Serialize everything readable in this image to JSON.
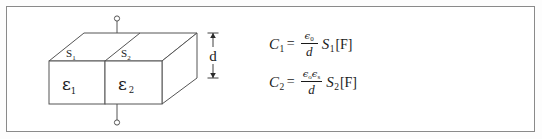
{
  "figure": {
    "type": "parallel-plate-capacitor-dielectric-diagram",
    "border_color": "#8a8a8a",
    "stroke_color": "#555555",
    "text_color": "#1a1a1a",
    "background": "#ffffff"
  },
  "diagram": {
    "name": "two-section-dielectric-slab",
    "labels": {
      "area_1": "S",
      "area_1_sub": "1",
      "area_2": "S",
      "area_2_sub": "2",
      "permittivity_1": "ε",
      "permittivity_1_sub": "1",
      "permittivity_2": "ε",
      "permittivity_2_sub": "2",
      "thickness": "d"
    },
    "terminals": {
      "top": "top-terminal-node",
      "bottom": "bottom-terminal-node"
    }
  },
  "formulas": {
    "c1": {
      "lhs": "C",
      "lhs_sub": "1",
      "eq": "=",
      "numerator_sym": "ϵ",
      "numerator_sub": "0",
      "denominator": "d",
      "area": "S",
      "area_sub": "1",
      "unit": "[F]"
    },
    "c2": {
      "lhs": "C",
      "lhs_sub": "2",
      "eq": "=",
      "numerator_sym_1": "ϵ",
      "numerator_sub_1": "o",
      "numerator_sym_2": "ϵ",
      "numerator_sub_2": "s",
      "denominator": "d",
      "area": "S",
      "area_sub": "2",
      "unit": "[F]"
    }
  }
}
